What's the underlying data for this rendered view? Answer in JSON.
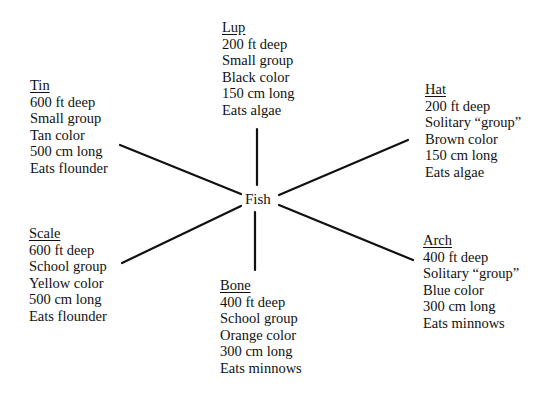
{
  "center": {
    "label": "Fish"
  },
  "nodes": {
    "lup": {
      "name": "Lup",
      "depth": "200 ft deep",
      "group": "Small group",
      "color": "Black color",
      "length": "150 cm long",
      "diet": "Eats algae"
    },
    "tin": {
      "name": "Tin",
      "depth": "600 ft deep",
      "group": "Small group",
      "color": "Tan color",
      "length": "500 cm long",
      "diet": "Eats flounder"
    },
    "hat": {
      "name": "Hat",
      "depth": "200 ft deep",
      "group": "Solitary “group”",
      "color": "Brown color",
      "length": "150 cm long",
      "diet": "Eats algae"
    },
    "scale": {
      "name": "Scale",
      "depth": "600 ft deep",
      "group": "School group",
      "color": "Yellow color",
      "length": "500 cm long",
      "diet": "Eats flounder"
    },
    "arch": {
      "name": "Arch",
      "depth": "400 ft deep",
      "group": "Solitary “group”",
      "color": "Blue color",
      "length": "300 cm long",
      "diet": "Eats minnows"
    },
    "bone": {
      "name": "Bone",
      "depth": "400 ft deep",
      "group": "School group",
      "color": "Orange color",
      "length": "300 cm long",
      "diet": "Eats minnows"
    }
  }
}
